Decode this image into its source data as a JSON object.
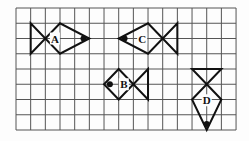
{
  "diagram": {
    "grid": {
      "cols": 15,
      "rows": 8,
      "left": 16,
      "top": 8,
      "cell_w": 14.67,
      "cell_h": 15.25,
      "line_color": "#555555"
    },
    "fish": [
      {
        "label": "A",
        "facing": "right",
        "tail": [
          [
            1,
            1
          ],
          [
            1,
            3
          ],
          [
            2,
            2
          ]
        ],
        "body": [
          [
            2,
            2
          ],
          [
            3,
            1
          ],
          [
            5,
            2
          ],
          [
            3,
            3
          ]
        ],
        "eye": [
          4.6,
          2
        ],
        "label_pos": [
          2.65,
          2
        ]
      },
      {
        "label": "C",
        "facing": "left",
        "tail": [
          [
            11,
            1
          ],
          [
            11,
            3
          ],
          [
            10,
            2
          ]
        ],
        "body": [
          [
            10,
            2
          ],
          [
            9,
            1
          ],
          [
            7,
            2
          ],
          [
            9,
            3
          ]
        ],
        "eye": [
          7.4,
          2
        ],
        "label_pos": [
          8.6,
          2
        ]
      },
      {
        "label": "B",
        "facing": "left",
        "tail": [
          [
            9,
            4
          ],
          [
            9,
            6
          ],
          [
            8,
            5
          ]
        ],
        "body": [
          [
            8,
            5
          ],
          [
            7,
            4
          ],
          [
            6,
            5
          ],
          [
            7,
            6
          ]
        ],
        "eye": [
          6.4,
          5
        ],
        "label_pos": [
          7.35,
          5
        ]
      },
      {
        "label": "D",
        "facing": "down",
        "tail": [
          [
            12,
            4
          ],
          [
            14,
            4
          ],
          [
            13,
            5
          ]
        ],
        "body": [
          [
            13,
            5
          ],
          [
            12,
            6
          ],
          [
            13,
            8
          ],
          [
            14,
            6
          ]
        ],
        "eye": [
          13,
          7.6
        ],
        "label_pos": [
          13,
          6.05
        ]
      }
    ]
  }
}
